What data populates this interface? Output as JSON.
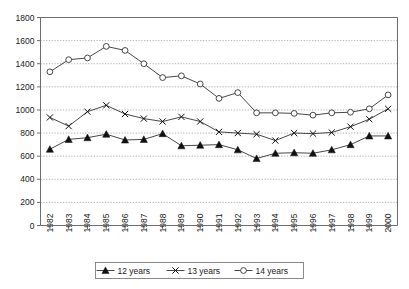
{
  "chart_data": {
    "type": "line",
    "title": "",
    "subtitle": "",
    "xlabel": "",
    "ylabel": "",
    "ylim": [
      0,
      1800
    ],
    "ytick_step": 200,
    "yticks": [
      0,
      200,
      400,
      600,
      800,
      1000,
      1200,
      1400,
      1600,
      1800
    ],
    "grid": true,
    "grid_axis": "y",
    "legend_position": "bottom",
    "categories": [
      "1982",
      "1983",
      "1984",
      "1985",
      "1986",
      "1987",
      "1988",
      "1989",
      "1990",
      "1991",
      "1992",
      "1993",
      "1994",
      "1995",
      "1996",
      "1997",
      "1998",
      "1999",
      "2000"
    ],
    "x": [
      1982,
      1983,
      1984,
      1985,
      1986,
      1987,
      1988,
      1989,
      1990,
      1991,
      1992,
      1993,
      1994,
      1995,
      1996,
      1997,
      1998,
      1999,
      2000
    ],
    "series": [
      {
        "name": "12 years",
        "marker": "filled-triangle",
        "values": [
          660,
          745,
          760,
          790,
          740,
          745,
          795,
          690,
          695,
          700,
          655,
          580,
          625,
          630,
          625,
          655,
          700,
          775,
          775
        ]
      },
      {
        "name": "13 years",
        "marker": "x-cross",
        "values": [
          935,
          860,
          985,
          1040,
          965,
          925,
          900,
          940,
          900,
          810,
          800,
          790,
          735,
          800,
          795,
          805,
          855,
          920,
          1010
        ]
      },
      {
        "name": "14 years",
        "marker": "open-circle",
        "values": [
          1330,
          1435,
          1450,
          1550,
          1515,
          1400,
          1280,
          1295,
          1225,
          1100,
          1150,
          975,
          975,
          970,
          955,
          975,
          980,
          1010,
          1130
        ]
      }
    ],
    "colors": {
      "series_line": "#333333",
      "grid": "#9a9a9a",
      "axis": "#6e6e6e",
      "marker_fill": "#111111",
      "background": "#ffffff"
    }
  },
  "legend": {
    "items": [
      {
        "label": "12 years",
        "marker": "filled-triangle"
      },
      {
        "label": "13 years",
        "marker": "x-cross"
      },
      {
        "label": "14 years",
        "marker": "open-circle"
      }
    ]
  }
}
